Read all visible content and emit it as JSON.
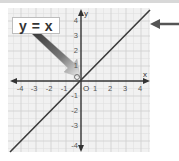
{
  "diagram": {
    "equation_label": "y = x",
    "x_axis_label": "x",
    "y_axis_label": "y",
    "origin_label": "O",
    "x_ticks": [
      "-4",
      "-3",
      "-2",
      "-1",
      "1",
      "2",
      "3",
      "4"
    ],
    "y_ticks": [
      "4",
      "3",
      "2",
      "1",
      "-1",
      "-2",
      "-3",
      "-4"
    ],
    "colors": {
      "grid_bg": "#f1f1f1",
      "grid_minor": "#e2e2e2",
      "grid_major": "#d2d2d2",
      "axis": "#333333",
      "line": "#3a3a3a",
      "pointer_arrow": "#5a5a5a"
    }
  }
}
